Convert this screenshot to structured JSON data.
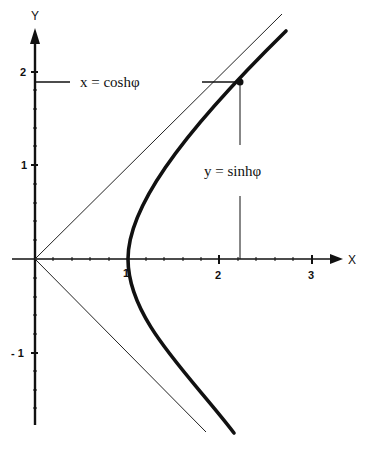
{
  "diagram": {
    "axes": {
      "x_label": "X",
      "y_label": "Y",
      "x_ticks": [
        "1",
        "2",
        "3"
      ],
      "y_ticks": [
        "2",
        "1",
        "- 1"
      ]
    },
    "annotations": {
      "x_param": "x = coshφ",
      "y_param": "y = sinhφ"
    },
    "point": {
      "x": 2.22,
      "y": 1.9
    },
    "curves": [
      {
        "name": "hyperbola right branch",
        "equation": "x² − y² = 1",
        "style": "thick"
      },
      {
        "name": "asymptote",
        "equation": "y = x",
        "style": "thin"
      },
      {
        "name": "asymptote",
        "equation": "y = −x",
        "style": "thin"
      }
    ]
  }
}
